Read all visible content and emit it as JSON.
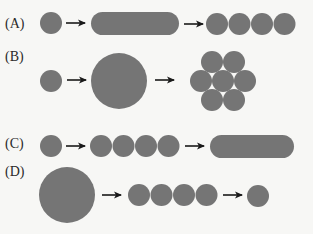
{
  "colors": {
    "shape": "#757575",
    "arrow": "#1a1a1a",
    "label": "#2a2a2a",
    "background": "#f7f7f5"
  },
  "rows": [
    {
      "label": "(A)",
      "sequence": [
        "small-circle",
        "arrow",
        "long-pill",
        "arrow",
        "four-circles-in-row"
      ]
    },
    {
      "label": "(B)",
      "sequence": [
        "small-circle",
        "arrow",
        "large-circle",
        "arrow",
        "seven-circles-hex-cluster"
      ]
    },
    {
      "label": "(C)",
      "sequence": [
        "small-circle",
        "arrow",
        "four-circles-in-row",
        "arrow",
        "long-pill"
      ]
    },
    {
      "label": "(D)",
      "sequence": [
        "large-circle",
        "arrow",
        "four-circles-in-row",
        "arrow",
        "small-circle"
      ]
    }
  ]
}
